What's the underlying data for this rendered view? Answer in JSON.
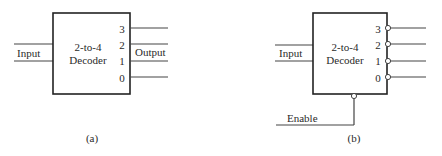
{
  "diagram_a": {
    "caption": "(a)",
    "block_title_line1": "2-to-4",
    "block_title_line2": "Decoder",
    "input_label": "Input",
    "output_label": "Output",
    "output_pins": [
      "3",
      "2",
      "1",
      "0"
    ],
    "active_low_outputs": false,
    "enable": null
  },
  "diagram_b": {
    "caption": "(b)",
    "block_title_line1": "2-to-4",
    "block_title_line2": "Decoder",
    "input_label": "Input",
    "output_pins": [
      "3",
      "2",
      "1",
      "0"
    ],
    "active_low_outputs": true,
    "enable_label": "Enable",
    "enable_active_low": true
  },
  "colors": {
    "line": "#444444",
    "box_border": "#222222",
    "text": "#2a2a2a",
    "background": "#ffffff"
  }
}
